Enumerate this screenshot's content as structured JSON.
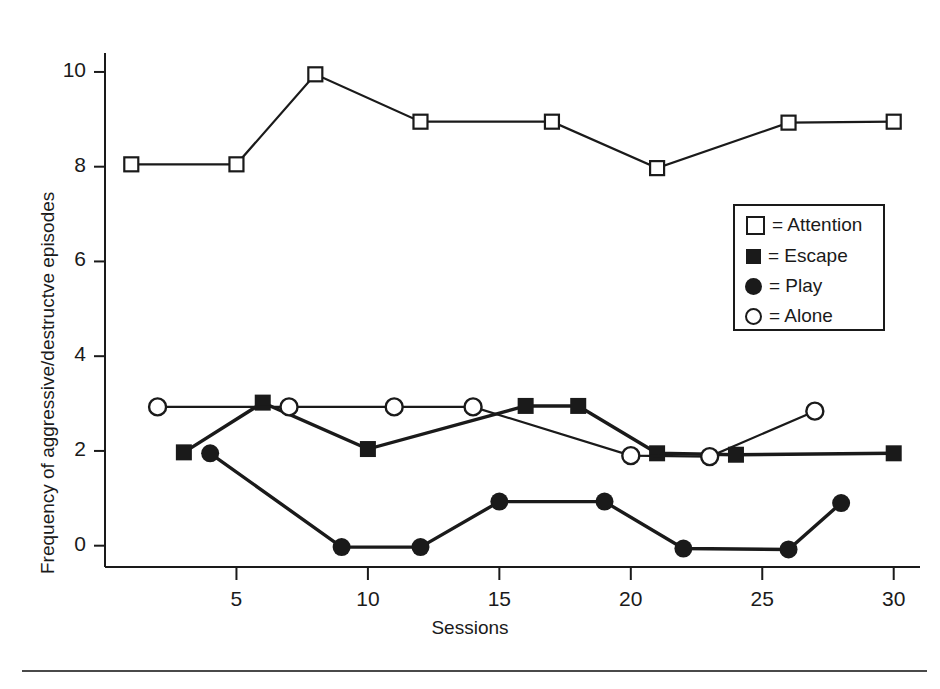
{
  "chart_data": {
    "type": "line",
    "title": "",
    "xlabel": "Sessions",
    "ylabel": "Frequency of aggressive/destructve episodes",
    "xlim": [
      0,
      31
    ],
    "ylim": [
      -0.45,
      10.4
    ],
    "xticks": [
      5,
      10,
      15,
      20,
      25,
      30
    ],
    "xtick_labels": [
      "5",
      "10",
      "15",
      "20",
      "25",
      "30"
    ],
    "yticks": [
      0,
      2,
      4,
      6,
      8,
      10
    ],
    "ytick_labels": [
      "0",
      "2",
      "4",
      "6",
      "8",
      "10"
    ],
    "grid": false,
    "legend_position": "upper right",
    "series": [
      {
        "name": "Attention",
        "marker": "open-square",
        "color": "#1a1a1a",
        "points": [
          {
            "x": 1,
            "y": 8.05
          },
          {
            "x": 5,
            "y": 8.05
          },
          {
            "x": 8,
            "y": 9.95
          },
          {
            "x": 12,
            "y": 8.95
          },
          {
            "x": 17,
            "y": 8.95
          },
          {
            "x": 21,
            "y": 7.97
          },
          {
            "x": 26,
            "y": 8.93
          },
          {
            "x": 30,
            "y": 8.95
          }
        ]
      },
      {
        "name": "Escape",
        "marker": "filled-square",
        "color": "#1a1a1a",
        "points": [
          {
            "x": 3,
            "y": 1.97
          },
          {
            "x": 6,
            "y": 3.02
          },
          {
            "x": 10,
            "y": 2.04
          },
          {
            "x": 16,
            "y": 2.95
          },
          {
            "x": 18,
            "y": 2.95
          },
          {
            "x": 21,
            "y": 1.95
          },
          {
            "x": 24,
            "y": 1.92
          },
          {
            "x": 30,
            "y": 1.95
          }
        ]
      },
      {
        "name": "Play",
        "marker": "filled-circle",
        "color": "#1a1a1a",
        "points": [
          {
            "x": 4,
            "y": 1.95
          },
          {
            "x": 9,
            "y": -0.03
          },
          {
            "x": 12,
            "y": -0.03
          },
          {
            "x": 15,
            "y": 0.93
          },
          {
            "x": 19,
            "y": 0.93
          },
          {
            "x": 22,
            "y": -0.06
          },
          {
            "x": 26,
            "y": -0.08
          },
          {
            "x": 28,
            "y": 0.9
          }
        ]
      },
      {
        "name": "Alone",
        "marker": "open-circle",
        "color": "#1a1a1a",
        "points": [
          {
            "x": 2,
            "y": 2.93
          },
          {
            "x": 7,
            "y": 2.93
          },
          {
            "x": 11,
            "y": 2.93
          },
          {
            "x": 14,
            "y": 2.93
          },
          {
            "x": 20,
            "y": 1.9
          },
          {
            "x": 23,
            "y": 1.88
          },
          {
            "x": 27,
            "y": 2.84
          }
        ]
      }
    ]
  },
  "legend": {
    "items": [
      {
        "marker": "open-square",
        "label": "= Attention"
      },
      {
        "marker": "filled-square",
        "label": "= Escape"
      },
      {
        "marker": "filled-circle",
        "label": "= Play"
      },
      {
        "marker": "open-circle",
        "label": "= Alone"
      }
    ]
  }
}
